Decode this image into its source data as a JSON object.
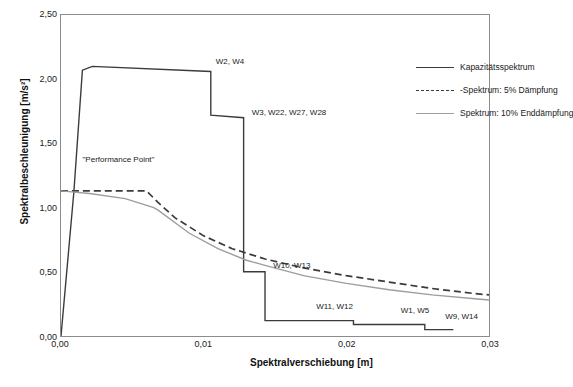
{
  "chart_data": {
    "type": "line",
    "title": "",
    "xlabel": "Spektralverschiebung [m]",
    "ylabel": "Spektralbeschleunigung [m/s²]",
    "xlim": [
      0,
      0.03
    ],
    "ylim": [
      0,
      2.5
    ],
    "xticks": [
      "0,00",
      "0,01",
      "0,02",
      "0,03"
    ],
    "xtick_values": [
      0.0,
      0.01,
      0.02,
      0.03
    ],
    "yticks": [
      "0,00",
      "0,50",
      "1,00",
      "1,50",
      "2,00",
      "2,50"
    ],
    "ytick_values": [
      0.0,
      0.5,
      1.0,
      1.5,
      2.0,
      2.5
    ],
    "grid": false,
    "legend_position": "top-right",
    "series": [
      {
        "name": "Kapazitätsspektrum",
        "style": "solid",
        "color": "#3b3b3b",
        "points": [
          [
            0.0,
            0.0
          ],
          [
            0.0009,
            1.12
          ],
          [
            0.0015,
            2.07
          ],
          [
            0.0022,
            2.1
          ],
          [
            0.0105,
            2.06
          ],
          [
            0.0105,
            1.72
          ],
          [
            0.0128,
            1.7
          ],
          [
            0.0128,
            0.5
          ],
          [
            0.0143,
            0.5
          ],
          [
            0.0143,
            0.12
          ],
          [
            0.0205,
            0.12
          ],
          [
            0.0205,
            0.09
          ],
          [
            0.0255,
            0.09
          ],
          [
            0.0255,
            0.05
          ],
          [
            0.0275,
            0.05
          ]
        ]
      },
      {
        "name": "-Spektrum: 5% Dämpfung",
        "style": "dashed",
        "color": "#3b3b3b",
        "points": [
          [
            0.0,
            1.13
          ],
          [
            0.0013,
            1.13
          ],
          [
            0.006,
            1.13
          ],
          [
            0.0068,
            1.04
          ],
          [
            0.008,
            0.92
          ],
          [
            0.01,
            0.78
          ],
          [
            0.012,
            0.68
          ],
          [
            0.0143,
            0.6
          ],
          [
            0.017,
            0.53
          ],
          [
            0.02,
            0.47
          ],
          [
            0.023,
            0.42
          ],
          [
            0.026,
            0.37
          ],
          [
            0.029,
            0.33
          ],
          [
            0.03,
            0.32
          ]
        ]
      },
      {
        "name": "Spektrum: 10% Enddämpfung",
        "style": "solid",
        "color": "#9d9d9d",
        "points": [
          [
            0.0,
            1.13
          ],
          [
            0.002,
            1.11
          ],
          [
            0.0045,
            1.07
          ],
          [
            0.0065,
            1.0
          ],
          [
            0.0068,
            0.98
          ],
          [
            0.009,
            0.8
          ],
          [
            0.011,
            0.68
          ],
          [
            0.013,
            0.59
          ],
          [
            0.0143,
            0.55
          ],
          [
            0.017,
            0.47
          ],
          [
            0.02,
            0.41
          ],
          [
            0.023,
            0.36
          ],
          [
            0.026,
            0.32
          ],
          [
            0.029,
            0.29
          ],
          [
            0.03,
            0.28
          ]
        ]
      }
    ],
    "annotations": [
      {
        "text": "\"Performance Point\"",
        "x": 0.0015,
        "y": 1.38
      },
      {
        "text": "W2, W4",
        "x": 0.0108,
        "y": 2.1
      },
      {
        "text": "W3, W22, W27, W28",
        "x": 0.0133,
        "y": 1.7
      },
      {
        "text": "W10, W13",
        "x": 0.0148,
        "y": 0.52
      },
      {
        "text": "W11, W12",
        "x": 0.0178,
        "y": 0.2
      },
      {
        "text": "W1, W5",
        "x": 0.0237,
        "y": 0.17
      },
      {
        "text": "W9, W14",
        "x": 0.0268,
        "y": 0.12
      }
    ]
  },
  "legend": {
    "items": [
      {
        "label": "Kapazitätsspektrum"
      },
      {
        "label": "-Spektrum: 5% Dämpfung"
      },
      {
        "label": "Spektrum: 10% Enddämpfung"
      }
    ]
  }
}
